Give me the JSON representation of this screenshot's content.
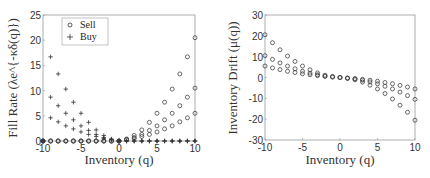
{
  "chart_data": [
    {
      "type": "scatter",
      "title": "",
      "xlabel": "Inventory (q)",
      "ylabel": "Fill Rate (λe^{-κδ(q)})",
      "xlim": [
        -10,
        10
      ],
      "ylim": [
        0,
        25
      ],
      "xticks": [
        "-10",
        "-5",
        "0",
        "5",
        "10"
      ],
      "yticks": [
        "0",
        "5",
        "10",
        "15",
        "20",
        "25"
      ],
      "legend": {
        "position": "top-left",
        "entries": [
          {
            "name": "Sell",
            "marker": "circle"
          },
          {
            "name": "Buy",
            "marker": "plus"
          }
        ]
      },
      "x": [
        -10,
        -9,
        -8,
        -7,
        -6,
        -5,
        -4,
        -3,
        -2,
        -1,
        0,
        1,
        2,
        3,
        4,
        5,
        6,
        7,
        8,
        9,
        10
      ],
      "series": [
        {
          "name": "Sell",
          "marker": "circle",
          "values": [
            [
              0,
              0,
              0,
              0,
              0,
              0,
              0,
              0,
              0,
              0,
              0,
              0.4,
              1.1,
              2.2,
              3.7,
              5.5,
              7.7,
              10.3,
              13.3,
              16.7,
              20.5
            ],
            [
              0,
              0,
              0,
              0,
              0,
              0,
              0,
              0,
              0,
              0,
              0,
              0.3,
              0.7,
              1.3,
              2.1,
              3.0,
              4.2,
              5.5,
              7.0,
              8.7,
              10.5
            ],
            [
              0,
              0,
              0,
              0,
              0,
              0,
              0,
              0,
              0,
              0,
              0,
              0.25,
              0.5,
              0.9,
              1.3,
              1.8,
              2.4,
              3.0,
              3.8,
              4.6,
              5.5
            ]
          ]
        },
        {
          "name": "Buy",
          "marker": "plus",
          "values": [
            [
              0,
              16.7,
              13.3,
              10.3,
              7.7,
              5.5,
              3.7,
              2.2,
              1.1,
              0.4,
              0,
              0,
              0,
              0,
              0,
              0,
              0,
              0,
              0,
              0,
              0
            ],
            [
              0,
              8.7,
              7.0,
              5.5,
              4.2,
              3.0,
              2.1,
              1.3,
              0.7,
              0.3,
              0,
              0,
              0,
              0,
              0,
              0,
              0,
              0,
              0,
              0,
              0
            ],
            [
              0,
              4.6,
              3.8,
              3.0,
              2.4,
              1.8,
              1.3,
              0.9,
              0.5,
              0.25,
              0,
              0,
              0,
              0,
              0,
              0,
              0,
              0,
              0,
              0,
              0
            ]
          ]
        }
      ]
    },
    {
      "type": "scatter",
      "title": "",
      "xlabel": "Inventory (q)",
      "ylabel": "Inventory Drift (μ(q))",
      "xlim": [
        -10,
        10
      ],
      "ylim": [
        -30,
        30
      ],
      "xticks": [
        "-10",
        "-5",
        "0",
        "5",
        "10"
      ],
      "yticks": [
        "-30",
        "-20",
        "-10",
        "0",
        "10",
        "20",
        "30"
      ],
      "x": [
        -10,
        -9,
        -8,
        -7,
        -6,
        -5,
        -4,
        -3,
        -2,
        -1,
        0,
        1,
        2,
        3,
        4,
        5,
        6,
        7,
        8,
        9,
        10
      ],
      "series": [
        {
          "name": "Drift",
          "marker": "circle",
          "values": [
            [
              20.5,
              16.7,
              13.3,
              10.3,
              7.7,
              5.5,
              3.7,
              2.2,
              1.1,
              0.4,
              0,
              -0.4,
              -1.1,
              -2.2,
              -3.7,
              -5.5,
              -7.7,
              -10.3,
              -13.3,
              -16.7,
              -20.5
            ],
            [
              10.5,
              8.7,
              7.0,
              5.5,
              4.2,
              3.0,
              2.1,
              1.3,
              0.7,
              0.3,
              0,
              -0.3,
              -0.7,
              -1.3,
              -2.1,
              -3.0,
              -4.2,
              -5.5,
              -7.0,
              -8.7,
              -10.5
            ],
            [
              5.5,
              4.6,
              3.8,
              3.0,
              2.4,
              1.8,
              1.3,
              0.9,
              0.5,
              0.25,
              0,
              -0.25,
              -0.5,
              -0.9,
              -1.3,
              -1.8,
              -2.4,
              -3.0,
              -3.8,
              -4.6,
              -5.5
            ]
          ]
        }
      ]
    }
  ]
}
